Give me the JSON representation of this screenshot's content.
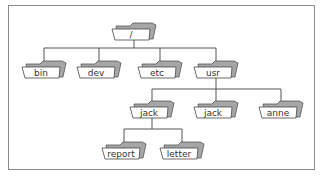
{
  "diagram": {
    "type": "directory-tree",
    "colors": {
      "line": "#555555",
      "folder_back": "#a6a6a6",
      "folder_front": "#ffffff",
      "frame": "#8a8a8a",
      "text": "#333333"
    },
    "nodes": [
      {
        "id": "root",
        "label": "/",
        "parent": null,
        "cx": 134,
        "y": 22
      },
      {
        "id": "bin",
        "label": "bin",
        "parent": "root",
        "cx": 44,
        "y": 60
      },
      {
        "id": "dev",
        "label": "dev",
        "parent": "root",
        "cx": 99,
        "y": 60
      },
      {
        "id": "etc",
        "label": "etc",
        "parent": "root",
        "cx": 160,
        "y": 60
      },
      {
        "id": "usr",
        "label": "usr",
        "parent": "root",
        "cx": 216,
        "y": 60
      },
      {
        "id": "jack1",
        "label": "jack",
        "parent": "usr",
        "cx": 152,
        "y": 100
      },
      {
        "id": "jack2",
        "label": "jack",
        "parent": "usr",
        "cx": 216,
        "y": 100
      },
      {
        "id": "anne",
        "label": "anne",
        "parent": "usr",
        "cx": 281,
        "y": 100
      },
      {
        "id": "report",
        "label": "report",
        "parent": "jack1",
        "cx": 124,
        "y": 141
      },
      {
        "id": "letter",
        "label": "letter",
        "parent": "jack1",
        "cx": 182,
        "y": 141
      }
    ]
  }
}
